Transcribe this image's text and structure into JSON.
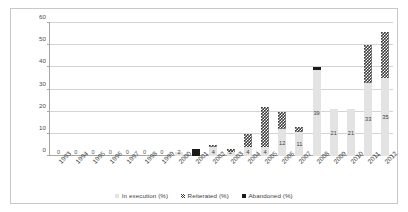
{
  "chart_data": {
    "type": "bar",
    "subtype": "stacked-column",
    "title": "",
    "xlabel": "",
    "ylabel": "",
    "ylim": [
      0,
      60
    ],
    "ytick_step": 10,
    "yticks": [
      0,
      10,
      20,
      30,
      40,
      50,
      60
    ],
    "grid": true,
    "legend_position": "bottom",
    "categories": [
      "1993",
      "1994",
      "1995",
      "1996",
      "1997",
      "1998",
      "1999",
      "2000",
      "2001",
      "2002",
      "2003",
      "2004",
      "2005",
      "2006",
      "2007",
      "2008",
      "2009",
      "2010",
      "2011",
      "2012"
    ],
    "series": [
      {
        "name": "In execution  (%)",
        "color": "#e3e3e3",
        "values": [
          0,
          0,
          0,
          0,
          0,
          0,
          0,
          2,
          0,
          4,
          2,
          4,
          4,
          12,
          11,
          39,
          21,
          21,
          33,
          35
        ]
      },
      {
        "name": "Reiterated  (%)",
        "color": "#3b3b3b",
        "pattern": "checkered",
        "values": [
          0,
          0,
          0,
          0,
          0,
          0,
          0,
          0,
          0,
          1,
          1,
          6,
          18,
          8,
          2,
          0,
          0,
          0,
          17,
          21
        ]
      },
      {
        "name": "Abandoned  (%)",
        "color": "#1a1a1a",
        "values": [
          0,
          0,
          0,
          0,
          0,
          0,
          0,
          0,
          3,
          0,
          0,
          0,
          0,
          0,
          0,
          1,
          0,
          0,
          0,
          0
        ]
      }
    ],
    "totals": [
      0,
      0,
      0,
      0,
      0,
      0,
      0,
      2,
      3,
      5,
      3,
      10,
      22,
      20,
      13,
      40,
      21,
      21,
      50,
      56
    ],
    "value_labels": [
      "0",
      "0",
      "0",
      "0",
      "0",
      "0",
      "0",
      "2",
      "",
      "4",
      "2",
      "4",
      "4",
      "12",
      "11",
      "39",
      "21",
      "21",
      "33",
      "35"
    ],
    "zero_markers": [
      "0",
      "0",
      "0",
      "0",
      "0",
      "0",
      "0"
    ]
  },
  "legend": {
    "items": [
      {
        "label": "In execution  (%)"
      },
      {
        "label": "Reiterated  (%)"
      },
      {
        "label": "Abandoned  (%)"
      }
    ]
  }
}
